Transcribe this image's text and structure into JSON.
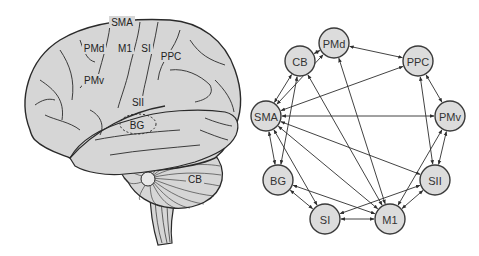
{
  "colors": {
    "node_fill": "#dcdcdc",
    "node_stroke": "#3a3a3a",
    "edge": "#2e2e2e",
    "brain_fill": "#d6d6d6",
    "brain_stroke": "#2a2a2a",
    "background": "#ffffff"
  },
  "brain": {
    "labels": {
      "SMA": "SMA",
      "PMd": "PMd",
      "M1": "M1",
      "SI": "SI",
      "PPC": "PPC",
      "PMv": "PMv",
      "SII": "SII",
      "BG": "BG",
      "CB": "CB"
    }
  },
  "network": {
    "nodes": [
      {
        "id": "PMd",
        "label": "PMd",
        "x": 334,
        "y": 43
      },
      {
        "id": "CB",
        "label": "CB",
        "x": 300,
        "y": 61
      },
      {
        "id": "PPC",
        "label": "PPC",
        "x": 418,
        "y": 61
      },
      {
        "id": "SMA",
        "label": "SMA",
        "x": 266,
        "y": 116
      },
      {
        "id": "PMv",
        "label": "PMv",
        "x": 450,
        "y": 116
      },
      {
        "id": "BG",
        "label": "BG",
        "x": 278,
        "y": 180
      },
      {
        "id": "SII",
        "label": "SII",
        "x": 435,
        "y": 180
      },
      {
        "id": "SI",
        "label": "SI",
        "x": 325,
        "y": 219
      },
      {
        "id": "M1",
        "label": "M1",
        "x": 390,
        "y": 219
      }
    ],
    "edges": [
      {
        "from": "CB",
        "to": "PMd",
        "bidirectional": true
      },
      {
        "from": "PMd",
        "to": "PPC",
        "bidirectional": true
      },
      {
        "from": "CB",
        "to": "SMA",
        "bidirectional": true
      },
      {
        "from": "PMd",
        "to": "SMA",
        "bidirectional": true
      },
      {
        "from": "PPC",
        "to": "SMA",
        "bidirectional": true
      },
      {
        "from": "SMA",
        "to": "PMv",
        "bidirectional": true
      },
      {
        "from": "PPC",
        "to": "PMv",
        "bidirectional": true
      },
      {
        "from": "SMA",
        "to": "BG",
        "bidirectional": true
      },
      {
        "from": "SMA",
        "to": "SI",
        "bidirectional": true
      },
      {
        "from": "SMA",
        "to": "M1",
        "bidirectional": true
      },
      {
        "from": "SMA",
        "to": "SII",
        "bidirectional": true
      },
      {
        "from": "CB",
        "to": "BG",
        "bidirectional": true
      },
      {
        "from": "CB",
        "to": "M1",
        "bidirectional": true
      },
      {
        "from": "PMd",
        "to": "M1",
        "bidirectional": true
      },
      {
        "from": "PPC",
        "to": "SII",
        "bidirectional": true
      },
      {
        "from": "PMv",
        "to": "SII",
        "bidirectional": true
      },
      {
        "from": "PMv",
        "to": "M1",
        "bidirectional": true
      },
      {
        "from": "BG",
        "to": "SI",
        "bidirectional": true
      },
      {
        "from": "BG",
        "to": "M1",
        "bidirectional": true
      },
      {
        "from": "SI",
        "to": "M1",
        "bidirectional": true
      },
      {
        "from": "SII",
        "to": "M1",
        "bidirectional": true
      },
      {
        "from": "SII",
        "to": "SI",
        "bidirectional": true
      }
    ],
    "node_radius": 15
  }
}
